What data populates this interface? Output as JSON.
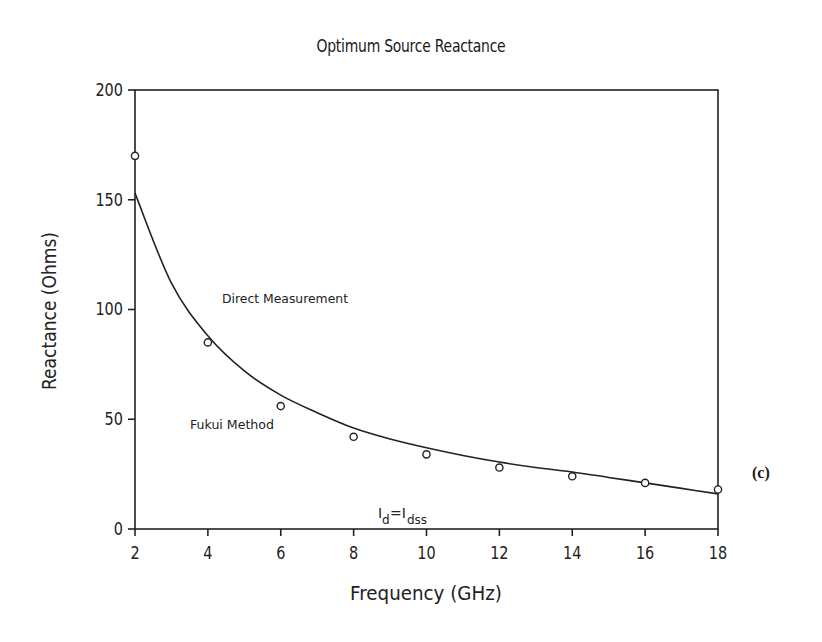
{
  "chart_data": {
    "type": "scatter",
    "title": "Optimum Source Reactance",
    "xlabel": "Frequency (GHz)",
    "ylabel": "Reactance (Ohms)",
    "xlim": [
      2,
      18
    ],
    "ylim": [
      0,
      200
    ],
    "xticks": [
      2,
      4,
      6,
      8,
      10,
      12,
      14,
      16,
      18
    ],
    "yticks": [
      0,
      50,
      100,
      150,
      200
    ],
    "grid": false,
    "legend": "none (inline annotations)",
    "series": [
      {
        "name": "Direct Measurement",
        "style": "open circle markers",
        "x": [
          2,
          4,
          6,
          8,
          10,
          12,
          14,
          16,
          18
        ],
        "y": [
          170,
          85,
          56,
          42,
          34,
          28,
          24,
          21,
          18
        ]
      },
      {
        "name": "Fukui Method",
        "style": "solid line",
        "x": [
          2,
          3,
          4,
          5,
          6,
          7,
          8,
          9,
          10,
          11,
          12,
          13,
          14,
          15,
          16,
          17,
          18
        ],
        "y": [
          153,
          112,
          88,
          72,
          61,
          53,
          46,
          41,
          37,
          33.5,
          30.5,
          28,
          26,
          23.5,
          21,
          18.5,
          16
        ]
      }
    ],
    "annotations": [
      {
        "text": "Direct Measurement",
        "x": 4.4,
        "y": 90
      },
      {
        "text": "Fukui Method",
        "x": 3.5,
        "y": 48
      },
      {
        "text": "Id=Idss",
        "x": 9.0,
        "y": 6
      },
      {
        "text": "(c)",
        "position": "right of plot"
      }
    ]
  },
  "labels": {
    "title": "Optimum Source Reactance",
    "xlabel": "Frequency (GHz)",
    "ylabel": "Reactance (Ohms)",
    "annot_direct": "Direct Measurement",
    "annot_fukui": "Fukui Method",
    "annot_id_main": "I",
    "annot_id_sub": "d",
    "annot_eq": "=I",
    "annot_idss_sub": "dss",
    "panel": "(c)"
  }
}
